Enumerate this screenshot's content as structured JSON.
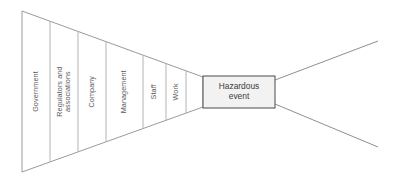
{
  "diagram": {
    "type": "bow-tie-hazard-funnel",
    "background_color": "#ffffff",
    "line_color": "#9a9a9a",
    "divider_color": "#b4b4b4",
    "event_box_fill": "#f2f2f2",
    "event_box_border": "#4a4a4a",
    "text_color": "#5a5a5a"
  },
  "funnel": {
    "left_edge_top_y": 11,
    "left_edge_bottom_y": 172,
    "apex_x": 203,
    "apex_top_y": 77,
    "apex_bottom_y": 107,
    "left_x": 22,
    "barriers": [
      {
        "id": "government",
        "label": "Government",
        "lines": [
          "Government"
        ],
        "left_x": 22,
        "right_x": 50,
        "center_x": 36
      },
      {
        "id": "regulators-and-associations",
        "label": "Regulators and associations",
        "lines": [
          "Regulators and",
          "associations"
        ],
        "left_x": 50,
        "right_x": 78,
        "center_x": 64
      },
      {
        "id": "company",
        "label": "Company",
        "lines": [
          "Company"
        ],
        "left_x": 78,
        "right_x": 106,
        "center_x": 92
      },
      {
        "id": "management",
        "label": "Management",
        "lines": [
          "Management"
        ],
        "left_x": 106,
        "right_x": 143,
        "center_x": 124
      },
      {
        "id": "staff",
        "label": "Staff",
        "lines": [
          "Staff"
        ],
        "left_x": 143,
        "right_x": 166,
        "center_x": 154
      },
      {
        "id": "work",
        "label": "Work",
        "lines": [
          "Work"
        ],
        "left_x": 166,
        "right_x": 186,
        "center_x": 176
      }
    ]
  },
  "event": {
    "id": "hazardous-event",
    "label": "Hazardous event",
    "lines": [
      "Hazardous",
      "event"
    ],
    "box": {
      "x": 203,
      "y": 76,
      "width": 72,
      "height": 32
    }
  },
  "consequences": {
    "origin_x": 275,
    "upper": {
      "x1": 275,
      "y1": 80,
      "x2": 378,
      "y2": 41
    },
    "lower": {
      "x1": 275,
      "y1": 104,
      "x2": 378,
      "y2": 147
    }
  }
}
